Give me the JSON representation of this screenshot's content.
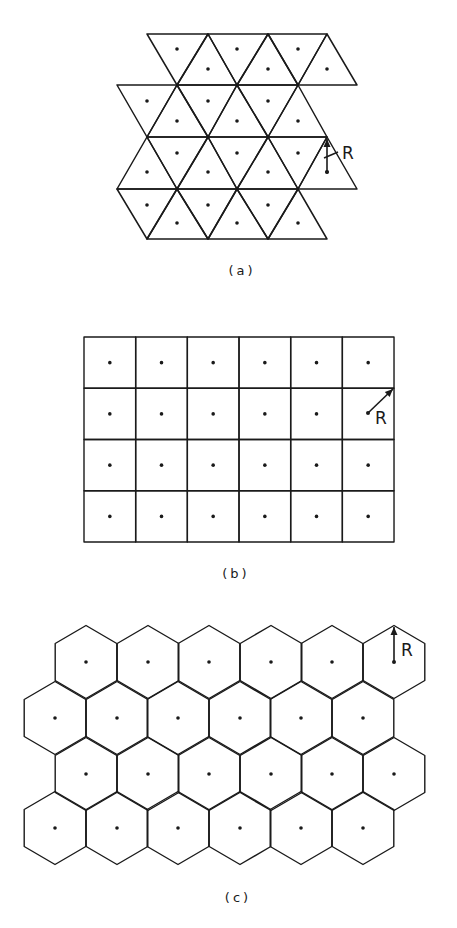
{
  "figure": {
    "panels": [
      {
        "id": "a",
        "caption": "(a)",
        "caption_pos": [
          242,
          275
        ],
        "type": "triangular-cells",
        "radius_label": "R",
        "rows": [
          {
            "triangles": [
              {
                "pts": [
                  [
                    147,
                    34
                  ],
                  [
                    208,
                    34
                  ],
                  [
                    177,
                    85
                  ]
                ],
                "dot": [
                  177,
                  49
                ]
              },
              {
                "pts": [
                  [
                    177,
                    85
                  ],
                  [
                    237,
                    85
                  ],
                  [
                    208,
                    34
                  ]
                ],
                "dot": [
                  208,
                  69
                ]
              },
              {
                "pts": [
                  [
                    208,
                    34
                  ],
                  [
                    268,
                    34
                  ],
                  [
                    237,
                    85
                  ]
                ],
                "dot": [
                  237,
                  49
                ]
              },
              {
                "pts": [
                  [
                    237,
                    85
                  ],
                  [
                    298,
                    85
                  ],
                  [
                    268,
                    34
                  ]
                ],
                "dot": [
                  268,
                  69
                ]
              },
              {
                "pts": [
                  [
                    268,
                    34
                  ],
                  [
                    327,
                    34
                  ],
                  [
                    298,
                    85
                  ]
                ],
                "dot": [
                  298,
                  49
                ]
              },
              {
                "pts": [
                  [
                    298,
                    85
                  ],
                  [
                    357,
                    85
                  ],
                  [
                    327,
                    34
                  ]
                ],
                "dot": [
                  327,
                  69
                ]
              }
            ]
          },
          {
            "triangles": [
              {
                "pts": [
                  [
                    117,
                    85
                  ],
                  [
                    177,
                    85
                  ],
                  [
                    147,
                    137
                  ]
                ],
                "dot": [
                  147,
                  101
                ]
              },
              {
                "pts": [
                  [
                    147,
                    137
                  ],
                  [
                    208,
                    137
                  ],
                  [
                    177,
                    85
                  ]
                ],
                "dot": [
                  177,
                  121
                ]
              },
              {
                "pts": [
                  [
                    177,
                    85
                  ],
                  [
                    237,
                    85
                  ],
                  [
                    208,
                    137
                  ]
                ],
                "dot": [
                  208,
                  101
                ]
              },
              {
                "pts": [
                  [
                    208,
                    137
                  ],
                  [
                    268,
                    137
                  ],
                  [
                    237,
                    85
                  ]
                ],
                "dot": [
                  237,
                  121
                ]
              },
              {
                "pts": [
                  [
                    237,
                    85
                  ],
                  [
                    298,
                    85
                  ],
                  [
                    268,
                    137
                  ]
                ],
                "dot": [
                  268,
                  101
                ]
              },
              {
                "pts": [
                  [
                    268,
                    137
                  ],
                  [
                    327,
                    137
                  ],
                  [
                    298,
                    85
                  ]
                ],
                "dot": [
                  298,
                  121
                ]
              }
            ]
          },
          {
            "triangles": [
              {
                "pts": [
                  [
                    117,
                    189
                  ],
                  [
                    177,
                    189
                  ],
                  [
                    147,
                    137
                  ]
                ],
                "dot": [
                  147,
                  172
                ]
              },
              {
                "pts": [
                  [
                    147,
                    137
                  ],
                  [
                    208,
                    137
                  ],
                  [
                    177,
                    189
                  ]
                ],
                "dot": [
                  177,
                  153
                ]
              },
              {
                "pts": [
                  [
                    177,
                    189
                  ],
                  [
                    237,
                    189
                  ],
                  [
                    208,
                    137
                  ]
                ],
                "dot": [
                  208,
                  172
                ]
              },
              {
                "pts": [
                  [
                    208,
                    137
                  ],
                  [
                    268,
                    137
                  ],
                  [
                    237,
                    189
                  ]
                ],
                "dot": [
                  237,
                  153
                ]
              },
              {
                "pts": [
                  [
                    237,
                    189
                  ],
                  [
                    298,
                    189
                  ],
                  [
                    268,
                    137
                  ]
                ],
                "dot": [
                  268,
                  172
                ]
              },
              {
                "pts": [
                  [
                    268,
                    137
                  ],
                  [
                    327,
                    137
                  ],
                  [
                    298,
                    189
                  ]
                ],
                "dot": [
                  298,
                  153
                ]
              },
              {
                "pts": [
                  [
                    298,
                    189
                  ],
                  [
                    357,
                    189
                  ],
                  [
                    327,
                    137
                  ]
                ],
                "dot": [
                  327,
                  172
                ]
              }
            ]
          },
          {
            "triangles": [
              {
                "pts": [
                  [
                    117,
                    189
                  ],
                  [
                    177,
                    189
                  ],
                  [
                    147,
                    239
                  ]
                ],
                "dot": [
                  147,
                  205
                ]
              },
              {
                "pts": [
                  [
                    147,
                    239
                  ],
                  [
                    208,
                    239
                  ],
                  [
                    177,
                    189
                  ]
                ],
                "dot": [
                  177,
                  223
                ]
              },
              {
                "pts": [
                  [
                    177,
                    189
                  ],
                  [
                    237,
                    189
                  ],
                  [
                    208,
                    239
                  ]
                ],
                "dot": [
                  208,
                  205
                ]
              },
              {
                "pts": [
                  [
                    208,
                    239
                  ],
                  [
                    268,
                    239
                  ],
                  [
                    237,
                    189
                  ]
                ],
                "dot": [
                  237,
                  223
                ]
              },
              {
                "pts": [
                  [
                    237,
                    189
                  ],
                  [
                    298,
                    189
                  ],
                  [
                    268,
                    239
                  ]
                ],
                "dot": [
                  268,
                  205
                ]
              },
              {
                "pts": [
                  [
                    268,
                    239
                  ],
                  [
                    327,
                    239
                  ],
                  [
                    298,
                    189
                  ]
                ],
                "dot": [
                  298,
                  223
                ]
              }
            ]
          }
        ],
        "radius_arrow": {
          "from": [
            327,
            172
          ],
          "to": [
            327,
            139
          ],
          "label_pos": [
            342,
            159
          ],
          "leader": [
            [
              324,
              158
            ],
            [
              338,
              152
            ]
          ]
        }
      },
      {
        "id": "b",
        "caption": "(b)",
        "caption_pos": [
          236,
          578
        ],
        "type": "square-cells",
        "radius_label": "R",
        "grid": {
          "x0": 84,
          "y0": 337,
          "cols": 6,
          "rows": 4,
          "cell_w": 51.67,
          "cell_h": 51.25
        },
        "radius_arrow": {
          "from": [
            368,
            413
          ],
          "to": [
            393,
            389
          ],
          "label_pos": [
            375,
            424
          ]
        }
      },
      {
        "id": "c",
        "caption": "(c)",
        "caption_pos": [
          238,
          902
        ],
        "type": "hexagonal-cells",
        "radius_label": "R",
        "hex": {
          "half_w": 30.8,
          "r_top": 36.5,
          "r_side": 18.5
        },
        "rows": [
          {
            "y": 662,
            "xs": [
              86,
              148,
              209,
              271,
              332,
              394
            ]
          },
          {
            "y": 718,
            "xs": [
              55,
              117,
              178,
              240,
              301,
              363
            ]
          },
          {
            "y": 774,
            "xs": [
              86,
              148,
              209,
              271,
              332,
              394
            ]
          },
          {
            "y": 828,
            "xs": [
              55,
              117,
              178,
              240,
              301,
              363
            ]
          }
        ],
        "radius_arrow": {
          "from": [
            394,
            662
          ],
          "to": [
            394,
            627
          ],
          "label_pos": [
            401,
            656
          ]
        }
      }
    ]
  }
}
